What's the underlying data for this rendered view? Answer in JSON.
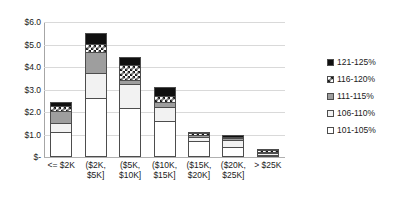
{
  "chart_data": {
    "type": "bar",
    "subtype": "stacked-column",
    "title": "",
    "xlabel": "",
    "ylabel": "",
    "ylim": [
      0,
      6
    ],
    "grid": true,
    "legend_position": "right",
    "y_ticks": [
      "$-",
      "$1.0",
      "$2.0",
      "$3.0",
      "$4.0",
      "$5.0",
      "$6.0"
    ],
    "y_tick_values": [
      0,
      1,
      2,
      3,
      4,
      5,
      6
    ],
    "categories": [
      "<= $2K",
      "($2K, $5K]",
      "($5K, $10K]",
      "($10K, $15K]",
      "($15K, $20K]",
      "($20K, $25K]",
      "> $25K"
    ],
    "category_lines": [
      [
        "<= $2K"
      ],
      [
        "($2K,",
        "$5K]"
      ],
      [
        "($5K,",
        "$10K]"
      ],
      [
        "($10K,",
        "$15K]"
      ],
      [
        "($15K,",
        "$20K]"
      ],
      [
        "($20K,",
        "$25K]"
      ],
      [
        "> $25K"
      ]
    ],
    "series": [
      {
        "name": "101-105%",
        "fill": "white",
        "color": "#ffffff",
        "values": [
          1.11,
          2.62,
          2.16,
          1.6,
          0.69,
          0.44,
          0.09
        ]
      },
      {
        "name": "106-110%",
        "fill": "light-gray",
        "color": "#f2f2f2",
        "values": [
          0.42,
          1.11,
          1.07,
          0.64,
          0.2,
          0.33,
          0.07
        ]
      },
      {
        "name": "111-115%",
        "fill": "gray",
        "color": "#9e9e9e",
        "values": [
          0.53,
          0.93,
          0.18,
          0.22,
          0.09,
          0.04,
          0.03
        ]
      },
      {
        "name": "116-120%",
        "fill": "checkerboard",
        "color": "#ffffff",
        "values": [
          0.2,
          0.36,
          0.67,
          0.24,
          0.07,
          0.04,
          0.02
        ]
      },
      {
        "name": "121-125%",
        "fill": "black",
        "color": "#101010",
        "values": [
          0.18,
          0.48,
          0.37,
          0.4,
          0.07,
          0.05,
          0.01
        ]
      }
    ],
    "totals": [
      2.44,
      5.5,
      4.45,
      3.1,
      1.12,
      0.9,
      0.22
    ]
  },
  "legend": {
    "items": [
      {
        "label": "121-125%",
        "fill": "black"
      },
      {
        "label": "116-120%",
        "fill": "checkerboard"
      },
      {
        "label": "111-115%",
        "fill": "gray"
      },
      {
        "label": "106-110%",
        "fill": "light-gray"
      },
      {
        "label": "101-105%",
        "fill": "white"
      }
    ]
  },
  "colors": {
    "gridline": "#d9d9d9",
    "axis": "#a6a6a6",
    "outline": "#4d4d4d",
    "text": "#1a1a1a"
  }
}
